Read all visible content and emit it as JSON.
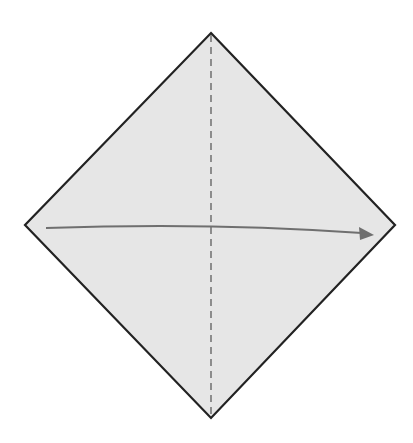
{
  "diagram": {
    "type": "origami-fold-step",
    "paper": {
      "shape": "square-rotated-45",
      "vertices": {
        "top": [
          211,
          33
        ],
        "right": [
          395,
          225
        ],
        "bottom": [
          211,
          418
        ],
        "left": [
          25,
          225
        ]
      },
      "fill": "#e6e6e6",
      "stroke": "#222222"
    },
    "fold_line": {
      "style": "valley-dashed",
      "from": [
        211,
        33
      ],
      "to": [
        211,
        418
      ],
      "color": "#777777"
    },
    "arrow": {
      "direction": "left-to-right",
      "from": [
        46,
        228
      ],
      "to": [
        372,
        235
      ],
      "color": "#777777"
    }
  }
}
